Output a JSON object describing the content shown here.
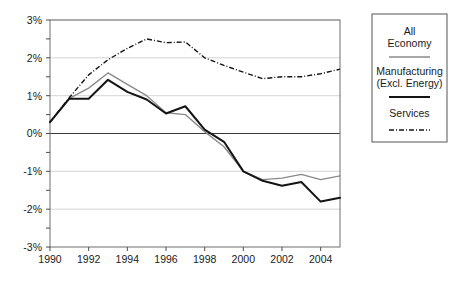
{
  "chart_data": {
    "type": "line",
    "title": "",
    "subtitle": "",
    "xlabel": "",
    "ylabel": "",
    "x": [
      1990,
      1991,
      1992,
      1993,
      1994,
      1995,
      1996,
      1997,
      1998,
      1999,
      2000,
      2001,
      2002,
      2003,
      2004,
      2005
    ],
    "xlim": [
      1990,
      2005
    ],
    "ylim": [
      -3,
      3
    ],
    "ytick_labels": [
      "3%",
      "2%",
      "1%",
      "0%",
      "-1%",
      "-2%",
      "-3%"
    ],
    "ytick_values": [
      3,
      2,
      1,
      0,
      -1,
      -2,
      -3
    ],
    "xtick_labels": [
      "1990",
      "1992",
      "1994",
      "1996",
      "1998",
      "2000",
      "2002",
      "2004"
    ],
    "xtick_values": [
      1990,
      1992,
      1994,
      1996,
      1998,
      2000,
      2002,
      2004
    ],
    "grid": true,
    "legend_position": "right-outside",
    "series": [
      {
        "name": "All Economy",
        "style": "solid-grey",
        "color": "#8a8a8a",
        "values": [
          0.3,
          0.93,
          1.2,
          1.6,
          1.3,
          1.0,
          0.55,
          0.5,
          0.05,
          -0.35,
          -1.0,
          -1.22,
          -1.18,
          -1.08,
          -1.22,
          -1.12
        ]
      },
      {
        "name": "Manufacturing (Excl. Energy)",
        "style": "solid-black",
        "color": "#141414",
        "values": [
          0.3,
          0.92,
          0.92,
          1.42,
          1.1,
          0.9,
          0.53,
          0.72,
          0.1,
          -0.22,
          -1.0,
          -1.25,
          -1.38,
          -1.28,
          -1.8,
          -1.7
        ]
      },
      {
        "name": "Services",
        "style": "dash-dot",
        "color": "#141414",
        "values": [
          0.3,
          0.95,
          1.55,
          1.95,
          2.25,
          2.5,
          2.4,
          2.42,
          2.0,
          1.8,
          1.62,
          1.45,
          1.5,
          1.5,
          1.58,
          1.7
        ]
      }
    ]
  },
  "legend": {
    "entries": [
      {
        "label_line1": "All",
        "label_line2": "Economy",
        "sample": "solid-grey-line"
      },
      {
        "label_line1": "Manufacturing",
        "label_line2": "(Excl. Energy)",
        "sample": "solid-black-line"
      },
      {
        "label_line1": "Services",
        "label_line2": "",
        "sample": "dash-dot-line"
      }
    ]
  },
  "colors": {
    "all_economy": "#8a8a8a",
    "manufacturing": "#141414",
    "services": "#141414",
    "grid": "#c9c9c9",
    "axis": "#6e6e6e",
    "background": "#ffffff"
  }
}
